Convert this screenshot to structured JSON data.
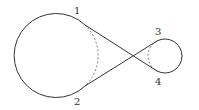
{
  "diagram": {
    "type": "crossed-belt tangent circles",
    "big_circle": {
      "cx": 57,
      "cy": 55,
      "r": 42
    },
    "small_circle": {
      "cx": 174,
      "cy": 56,
      "r": 17
    },
    "tangent_points": {
      "1": {
        "x": 85,
        "y": 25
      },
      "2": {
        "x": 85,
        "y": 86
      },
      "3": {
        "x": 157,
        "y": 41
      },
      "4": {
        "x": 157,
        "y": 71
      }
    },
    "labels": [
      {
        "id": "1",
        "text": "1",
        "x": 74,
        "y": 14
      },
      {
        "id": "2",
        "text": "2",
        "x": 74,
        "y": 105
      },
      {
        "id": "3",
        "text": "3",
        "x": 155,
        "y": 35
      },
      {
        "id": "4",
        "text": "4",
        "x": 155,
        "y": 85
      }
    ],
    "colors": {
      "stroke": "#333333",
      "dashed": "#555555"
    }
  }
}
